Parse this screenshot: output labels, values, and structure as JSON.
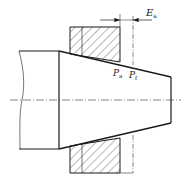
{
  "diagram": {
    "type": "mechanical-drawing",
    "labels": {
      "dimension": {
        "main": "E",
        "sub": "a"
      },
      "point_a": {
        "main": "P",
        "sub": "a"
      },
      "point_f": {
        "main": "P",
        "sub": "f"
      }
    },
    "colors": {
      "line": "#1a1a1a",
      "hatch": "#333333",
      "background": "#ffffff"
    }
  }
}
